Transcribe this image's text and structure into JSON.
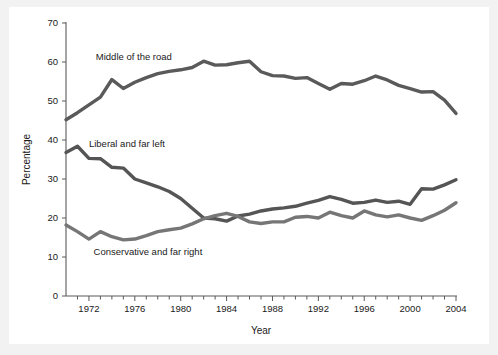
{
  "chart_data": {
    "type": "line",
    "title": "",
    "xlabel": "Year",
    "ylabel": "Percentage",
    "xlim": [
      1970,
      2004
    ],
    "ylim": [
      0,
      70
    ],
    "ytick_labels": [
      "0",
      "10",
      "20",
      "30",
      "40",
      "50",
      "60",
      "70"
    ],
    "ytick_values": [
      0,
      10,
      20,
      30,
      40,
      50,
      60,
      70
    ],
    "xtick_labels": [
      "1972",
      "1976",
      "1980",
      "1984",
      "1988",
      "1992",
      "1996",
      "2000",
      "2004"
    ],
    "xtick_values": [
      1972,
      1976,
      1980,
      1984,
      1988,
      1992,
      1996,
      2000,
      2004
    ],
    "minor_xticks_every": 1,
    "grid": false,
    "legend_position": "inline-annotations",
    "x": [
      1970,
      1971,
      1972,
      1973,
      1974,
      1975,
      1976,
      1977,
      1978,
      1979,
      1980,
      1981,
      1982,
      1983,
      1984,
      1985,
      1986,
      1987,
      1988,
      1989,
      1990,
      1991,
      1992,
      1993,
      1994,
      1995,
      1996,
      1997,
      1998,
      1999,
      2000,
      2001,
      2002,
      2003,
      2004
    ],
    "series": [
      {
        "name": "Middle of the road",
        "color": "#5a5a5a",
        "label_x": 1972.6,
        "label_y": 61.5,
        "values": [
          45.2,
          47.0,
          49.0,
          51.0,
          55.5,
          53.2,
          54.8,
          56.0,
          57.0,
          57.6,
          58.0,
          58.6,
          60.2,
          59.2,
          59.3,
          59.8,
          60.2,
          57.5,
          56.5,
          56.4,
          55.8,
          56.0,
          54.5,
          53.0,
          54.5,
          54.3,
          55.2,
          56.4,
          55.4,
          54.0,
          53.2,
          52.3,
          52.4,
          50.2,
          46.8
        ]
      },
      {
        "name": "Liberal and far left",
        "color": "#555555",
        "label_x": 1972.0,
        "label_y": 39.0,
        "values": [
          36.8,
          38.4,
          35.3,
          35.2,
          33.0,
          32.8,
          30.0,
          29.0,
          28.0,
          26.8,
          25.0,
          22.5,
          20.0,
          19.8,
          19.2,
          20.5,
          21.0,
          21.8,
          22.3,
          22.6,
          23.0,
          23.8,
          24.5,
          25.5,
          24.8,
          23.8,
          24.0,
          24.6,
          24.0,
          24.3,
          23.5,
          27.5,
          27.4,
          28.5,
          29.8
        ]
      },
      {
        "name": "Conservative and far right",
        "color": "#767676",
        "label_x": 1972.4,
        "label_y": 11.3,
        "values": [
          18.2,
          16.5,
          14.6,
          16.5,
          15.2,
          14.4,
          14.6,
          15.5,
          16.5,
          17.0,
          17.4,
          18.5,
          19.8,
          20.6,
          21.2,
          20.4,
          19.0,
          18.6,
          19.0,
          19.0,
          20.2,
          20.4,
          20.0,
          21.5,
          20.6,
          20.0,
          21.8,
          20.8,
          20.3,
          20.8,
          20.0,
          19.4,
          20.6,
          22.0,
          23.9
        ]
      }
    ]
  }
}
